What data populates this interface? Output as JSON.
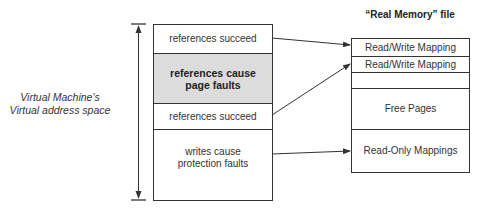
{
  "diagram": {
    "left_label": {
      "line1": "Virtual Machine's",
      "line2": "Virtual address space"
    },
    "virtual_space": {
      "segments": [
        {
          "label": "references succeed",
          "shaded": false
        },
        {
          "label_line1": "references cause",
          "label_line2": "page faults",
          "shaded": true
        },
        {
          "label": "references succeed",
          "shaded": false
        },
        {
          "label_line1": "writes cause",
          "label_line2": "protection faults",
          "shaded": false
        }
      ]
    },
    "real_memory": {
      "title": "“Real Memory” file",
      "segments": [
        {
          "label": "Read/Write Mapping"
        },
        {
          "label": "Read/Write Mapping"
        },
        {
          "label": ""
        },
        {
          "label": "Free Pages"
        },
        {
          "label": "Read-Only Mappings"
        }
      ]
    },
    "arrows": [
      {
        "from": "references succeed (1)",
        "to": "Read/Write Mapping (1)"
      },
      {
        "from": "references succeed (2)",
        "to": "Read/Write Mapping (2)"
      },
      {
        "from": "writes cause protection faults",
        "to": "Read-Only Mappings"
      }
    ],
    "colors": {
      "line": "#333333",
      "shaded_fill": "#dcdcdc",
      "background": "#ffffff"
    }
  }
}
